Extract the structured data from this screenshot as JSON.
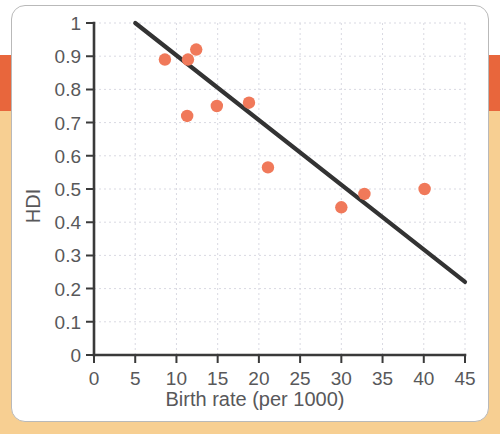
{
  "chart_data": {
    "type": "scatter",
    "title": "",
    "xlabel": "Birth rate (per 1000)",
    "ylabel": "HDI",
    "xlim": [
      0,
      45
    ],
    "ylim": [
      0,
      1
    ],
    "grid": true,
    "legend": null,
    "xticks": [
      "0",
      "5",
      "10",
      "15",
      "20",
      "25",
      "30",
      "35",
      "40",
      "45"
    ],
    "xtick_values": [
      0,
      5,
      10,
      15,
      20,
      25,
      30,
      35,
      40,
      45
    ],
    "yticks": [
      "0",
      "0.1",
      "0.2",
      "0.3",
      "0.4",
      "0.5",
      "0.6",
      "0.7",
      "0.8",
      "0.9",
      "1"
    ],
    "ytick_values": [
      0,
      0.1,
      0.2,
      0.3,
      0.4,
      0.5,
      0.6,
      0.7,
      0.8,
      0.9,
      1
    ],
    "point_color": "#f0795a",
    "line_color": "#333333",
    "axis_color": "#3a3a3a",
    "points": [
      {
        "x": 8.6,
        "y": 0.89
      },
      {
        "x": 11.4,
        "y": 0.89
      },
      {
        "x": 12.4,
        "y": 0.92
      },
      {
        "x": 11.3,
        "y": 0.72
      },
      {
        "x": 14.9,
        "y": 0.75
      },
      {
        "x": 18.8,
        "y": 0.76
      },
      {
        "x": 21.1,
        "y": 0.565
      },
      {
        "x": 30.0,
        "y": 0.445
      },
      {
        "x": 32.8,
        "y": 0.485
      },
      {
        "x": 40.1,
        "y": 0.5
      }
    ],
    "trend_line": {
      "x0": 5.0,
      "y0": 1.0,
      "x1": 45.0,
      "y1": 0.22
    }
  },
  "decor": {
    "band_red": "#e8663c",
    "band_tan": "#f7cf92",
    "card_bg": "#ffffff",
    "card_border": "#b9b9b9"
  }
}
